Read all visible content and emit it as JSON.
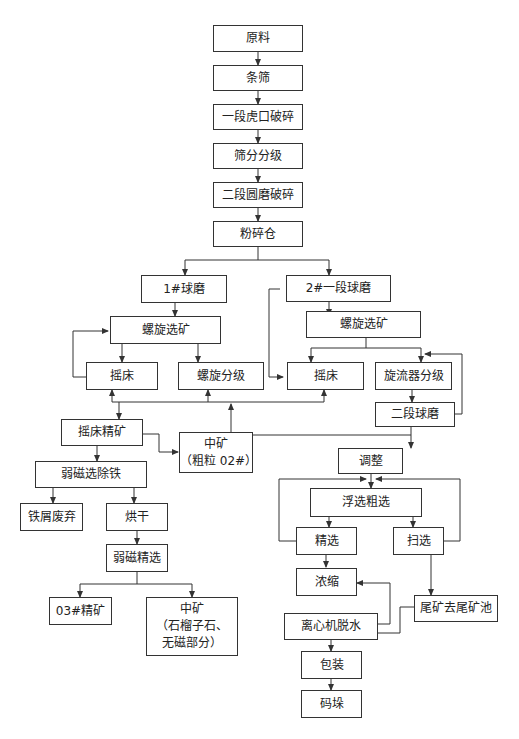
{
  "diagram": {
    "type": "process-flowchart",
    "nodes": {
      "raw_material": "原料",
      "bar_screen": "条筛",
      "jaw_crush": "一段虎口破碎",
      "screen_grading": "筛分分级",
      "cone_crush": "二段圆磨破碎",
      "powder_bin": "粉碎仓",
      "ball_mill_1": "1#球磨",
      "spiral_sep_1": "螺旋选矿",
      "shaking_table_1": "摇床",
      "spiral_class": "螺旋分级",
      "ball_mill_2": "2#一段球磨",
      "spiral_sep_2": "螺旋选矿",
      "shaking_table_2": "摇床",
      "cyclone_class": "旋流器分级",
      "second_ball_mill": "二段球磨",
      "table_concentrate": "摇床精矿",
      "middlings_coarse": "中矿\n（粗粒 02#）",
      "weak_mag_iron": "弱磁选除铁",
      "iron_scrap": "铁屑废弃",
      "drying": "烘干",
      "weak_mag_clean": "弱磁精选",
      "concentrate_03": "03#精矿",
      "middlings_garnet": "中矿\n（石榴子石、\n无磁部分）",
      "conditioning": "调整",
      "flotation_rough": "浮选粗选",
      "cleaning": "精选",
      "scavenging": "扫选",
      "thickening": "浓缩",
      "tailings_pond": "尾矿去尾矿池",
      "centrifuge_dewater": "离心机脱水",
      "packaging": "包装",
      "stacking": "码垛"
    },
    "edges": [
      [
        "raw_material",
        "bar_screen"
      ],
      [
        "bar_screen",
        "jaw_crush"
      ],
      [
        "jaw_crush",
        "screen_grading"
      ],
      [
        "screen_grading",
        "cone_crush"
      ],
      [
        "cone_crush",
        "powder_bin"
      ],
      [
        "powder_bin",
        "ball_mill_1"
      ],
      [
        "powder_bin",
        "ball_mill_2"
      ],
      [
        "ball_mill_1",
        "spiral_sep_1"
      ],
      [
        "spiral_sep_1",
        "shaking_table_1"
      ],
      [
        "spiral_sep_1",
        "spiral_class"
      ],
      [
        "shaking_table_1",
        "spiral_sep_1"
      ],
      [
        "ball_mill_2",
        "spiral_sep_2"
      ],
      [
        "ball_mill_2",
        "shaking_table_2"
      ],
      [
        "spiral_sep_2",
        "shaking_table_2"
      ],
      [
        "spiral_sep_2",
        "cyclone_class"
      ],
      [
        "cyclone_class",
        "second_ball_mill"
      ],
      [
        "second_ball_mill",
        "cyclone_class"
      ],
      [
        "second_ball_mill",
        "conditioning"
      ],
      [
        "second_ball_mill",
        "shaking_table_1"
      ],
      [
        "second_ball_mill",
        "spiral_class"
      ],
      [
        "second_ball_mill",
        "shaking_table_2"
      ],
      [
        "shaking_table_1",
        "table_concentrate"
      ],
      [
        "table_concentrate",
        "middlings_coarse"
      ],
      [
        "table_concentrate",
        "weak_mag_iron"
      ],
      [
        "weak_mag_iron",
        "iron_scrap"
      ],
      [
        "weak_mag_iron",
        "drying"
      ],
      [
        "drying",
        "weak_mag_clean"
      ],
      [
        "weak_mag_clean",
        "concentrate_03"
      ],
      [
        "weak_mag_clean",
        "middlings_garnet"
      ],
      [
        "conditioning",
        "flotation_rough"
      ],
      [
        "flotation_rough",
        "cleaning"
      ],
      [
        "flotation_rough",
        "scavenging"
      ],
      [
        "cleaning",
        "flotation_rough"
      ],
      [
        "scavenging",
        "flotation_rough"
      ],
      [
        "cleaning",
        "thickening"
      ],
      [
        "scavenging",
        "tailings_pond"
      ],
      [
        "centrifuge_dewater",
        "thickening"
      ],
      [
        "centrifuge_dewater",
        "tailings_pond"
      ],
      [
        "centrifuge_dewater",
        "packaging"
      ],
      [
        "packaging",
        "stacking"
      ]
    ]
  },
  "colors": {
    "line": "#333333",
    "box_border": "#333333",
    "background": "#ffffff"
  }
}
